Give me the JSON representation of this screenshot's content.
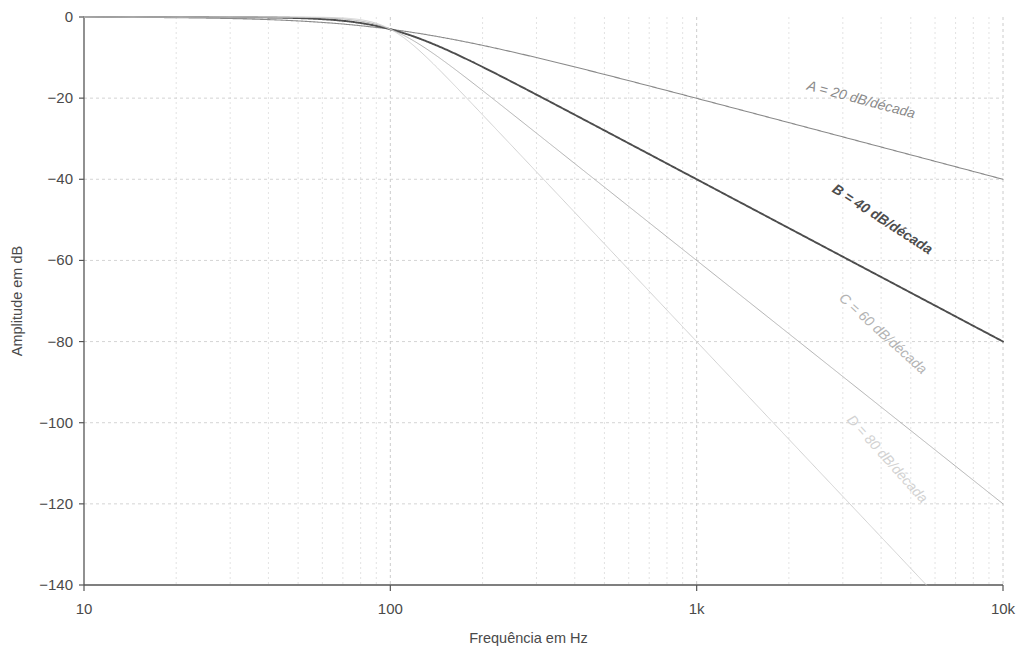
{
  "chart_data": {
    "type": "line",
    "title": "",
    "xlabel": "Frequência em Hz",
    "ylabel": "Amplitude em dB",
    "xscale": "log",
    "yscale": "linear",
    "xlim": [
      10,
      10000
    ],
    "ylim": [
      -140,
      0
    ],
    "grid": true,
    "legend_position": "inline-along-curves",
    "xticks": [
      {
        "value": 10,
        "label": "10"
      },
      {
        "value": 100,
        "label": "100"
      },
      {
        "value": 1000,
        "label": "1k"
      },
      {
        "value": 10000,
        "label": "10k"
      }
    ],
    "yticks": [
      {
        "value": 0,
        "label": "0"
      },
      {
        "value": -20,
        "label": "−20"
      },
      {
        "value": -40,
        "label": "−40"
      },
      {
        "value": -60,
        "label": "−60"
      },
      {
        "value": -80,
        "label": "−80"
      },
      {
        "value": -100,
        "label": "−100"
      },
      {
        "value": -120,
        "label": "−120"
      },
      {
        "value": -140,
        "label": "−140"
      }
    ],
    "cutoff_hz": 100,
    "series": [
      {
        "name": "A",
        "label": "A = 20 dB/década",
        "slope_db_per_decade": 20,
        "order": 1,
        "color": "#8a8a8a",
        "width": 1.1,
        "label_angle": 15,
        "label_x": 860,
        "label_y": 104,
        "points_hz": [
          10,
          20,
          30,
          50,
          70,
          100,
          150,
          200,
          300,
          500,
          700,
          1000,
          2000,
          3000,
          5000,
          7000,
          10000
        ],
        "points_db": [
          -0.04,
          -0.17,
          -0.37,
          -1.0,
          -1.9,
          -3.0,
          -5.1,
          -7.0,
          -10.0,
          -14.2,
          -17.0,
          -20.0,
          -26.1,
          -29.6,
          -34.0,
          -36.9,
          -40.0
        ],
        "end_db_at_10k": -37
      },
      {
        "name": "B",
        "label": "B = 40 dB/década",
        "slope_db_per_decade": 40,
        "order": 2,
        "color": "#4d4d4d",
        "width": 1.9,
        "label_angle": 33,
        "label_x": 880,
        "label_y": 223,
        "points_hz": [
          10,
          20,
          30,
          50,
          70,
          100,
          150,
          200,
          300,
          500,
          700,
          1000,
          2000,
          3000,
          5000,
          7000,
          10000
        ],
        "points_db": [
          -0.001,
          -0.01,
          -0.04,
          -0.3,
          -1.1,
          -3.0,
          -7.1,
          -12.3,
          -19.1,
          -28.0,
          -34.0,
          -40.0,
          -52.1,
          -59.2,
          -68.0,
          -73.8,
          -80.0
        ],
        "end_db_at_10k": -73
      },
      {
        "name": "C",
        "label": "C = 60 dB/década",
        "slope_db_per_decade": 60,
        "order": 3,
        "color": "#b3b3b3",
        "width": 1.0,
        "label_angle": 42,
        "label_x": 880,
        "label_y": 337,
        "points_hz": [
          10,
          20,
          30,
          50,
          70,
          100,
          150,
          200,
          300,
          500,
          700,
          1000,
          2000,
          3000,
          5000,
          7000,
          10000
        ],
        "points_db": [
          -0.0,
          -0.0,
          -0.004,
          -0.1,
          -0.6,
          -3.0,
          -9.6,
          -17.0,
          -28.0,
          -42.0,
          -51.0,
          -60.0,
          -78.2,
          -88.8,
          -102.0,
          -110.7,
          -120.0
        ],
        "end_db_at_10k": -109
      },
      {
        "name": "D",
        "label": "D = 80 dB/década",
        "slope_db_per_decade": 80,
        "order": 4,
        "color": "#d2d2d2",
        "width": 1.0,
        "label_angle": 48,
        "label_x": 884,
        "label_y": 462,
        "points_hz": [
          10,
          20,
          30,
          50,
          70,
          100,
          150,
          200,
          300,
          500,
          700,
          1000,
          2000,
          3000,
          5000,
          7000,
          9000
        ],
        "points_db": [
          -0.0,
          -0.0,
          -0.0,
          -0.03,
          -0.35,
          -3.0,
          -12.1,
          -22.5,
          -37.0,
          -56.0,
          -68.0,
          -80.0,
          -104.2,
          -118.4,
          -136.0,
          -140.0,
          -140.0
        ],
        "end_db_at_10k": -140
      }
    ]
  },
  "axes": {
    "plot_left": 84,
    "plot_right": 1003,
    "plot_top": 17,
    "plot_bottom": 585
  }
}
